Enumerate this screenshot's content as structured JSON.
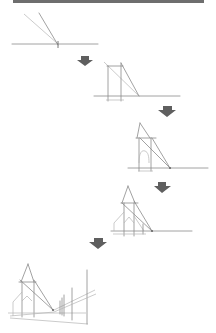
{
  "figure": {
    "steps": [
      {
        "index": 1,
        "label": "Horizon line with vanishing point and two converging construction lines"
      },
      {
        "index": 2,
        "label": "Vertical edges added forming a box toward the vanishing point"
      },
      {
        "index": 3,
        "label": "Steeple triangle and arched door sketched"
      },
      {
        "index": 4,
        "label": "Church facade detailed with roof lines"
      },
      {
        "index": 5,
        "label": "Complete scene with fence posts receding in perspective"
      }
    ],
    "arrow_count": 4,
    "colors": {
      "top_bar": "#6e6e6e",
      "arrow": "#5f5f5f",
      "sketch_line": "#8a8a8a",
      "background": "#ffffff"
    }
  }
}
